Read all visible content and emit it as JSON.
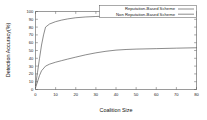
{
  "chart_data": {
    "type": "line",
    "title": "",
    "xlabel": "Coalition Size",
    "ylabel": "Detection Accuracy(%)",
    "xlim": [
      0,
      80
    ],
    "ylim": [
      0,
      100
    ],
    "grid": false,
    "legend_position": "upper right",
    "xticks": [
      0,
      10,
      20,
      30,
      40,
      50,
      60,
      70,
      80
    ],
    "xtick_labels": [
      "0",
      "10",
      "20",
      "30",
      "40",
      "50",
      "60",
      "70",
      "80"
    ],
    "yticks": [
      0,
      10,
      20,
      30,
      40,
      50,
      60,
      70,
      80,
      90,
      100
    ],
    "ytick_labels": [
      "0",
      "10",
      "20",
      "30",
      "40",
      "50",
      "60",
      "70",
      "80",
      "90",
      "100"
    ],
    "series": [
      {
        "name": "Reputation-Based  Scheme",
        "color": "#4d4d4d",
        "x": [
          0,
          1,
          2,
          3,
          4,
          5,
          7,
          10,
          13,
          16,
          20,
          25,
          30,
          35,
          40,
          50,
          60,
          70,
          80
        ],
        "values": [
          5,
          22,
          40,
          57,
          70,
          80,
          84,
          87,
          89,
          90.5,
          92,
          93,
          93.6,
          94,
          94.3,
          94.7,
          95,
          95.2,
          95.4
        ]
      },
      {
        "name": "Non Reputation-Based Scheme",
        "color": "#4d4d4d",
        "x": [
          0,
          1,
          2,
          3,
          5,
          7,
          10,
          13,
          16,
          20,
          25,
          30,
          35,
          40,
          45,
          50,
          60,
          70,
          80
        ],
        "values": [
          2,
          10,
          18,
          24,
          30,
          32.5,
          35,
          37,
          39,
          41.5,
          44.5,
          47,
          49,
          50.5,
          51.3,
          51.8,
          52.4,
          53,
          53.5
        ]
      }
    ]
  },
  "legend": {
    "entries": [
      {
        "label": "Reputation-Based  Scheme"
      },
      {
        "label": "Non Reputation-Based Scheme"
      }
    ]
  }
}
